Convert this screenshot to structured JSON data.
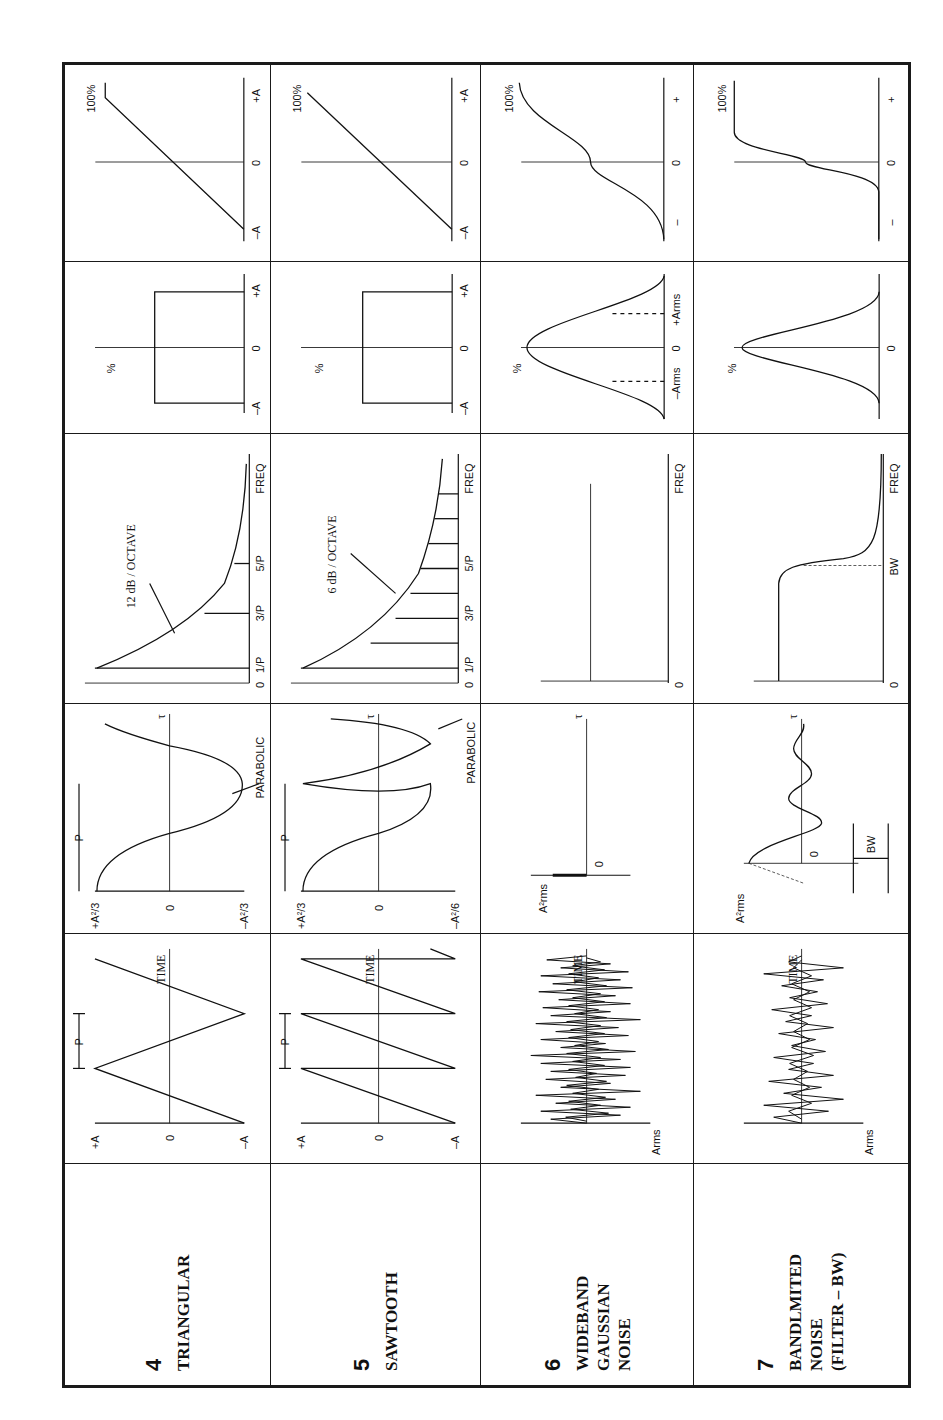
{
  "page": {
    "header_clipped": true,
    "orientation": "rotated -90deg (landscape table printed sideways)"
  },
  "table": {
    "columns": [
      "signal",
      "time_history",
      "autocorrelation",
      "spectrum",
      "amplitude_density",
      "cumulative_distribution"
    ],
    "rows": [
      {
        "number": "4",
        "name": "TRIANGULAR",
        "time_history": {
          "y_labels": [
            "+A",
            "0",
            "–A"
          ],
          "period_label": "P",
          "x_label": "TIME"
        },
        "autocorrelation": {
          "y_labels": [
            "+A²/3",
            "0",
            "–A²/3"
          ],
          "period_label": "P",
          "annotation": "PARABOLIC",
          "x_label": "τ"
        },
        "spectrum": {
          "annotation": "12 dB / OCTAVE",
          "x_labels": [
            "0",
            "1/P",
            "3/P",
            "5/P",
            "FREQ"
          ]
        },
        "amplitude_density": {
          "y_label": "%",
          "x_labels": [
            "–A",
            "0",
            "+A"
          ]
        },
        "cumulative_distribution": {
          "y_label": "100%",
          "x_labels": [
            "–A",
            "0",
            "+A"
          ]
        }
      },
      {
        "number": "5",
        "name": "SAWTOOTH",
        "time_history": {
          "y_labels": [
            "+A",
            "0",
            "–A"
          ],
          "period_label": "P",
          "x_label": "TIME"
        },
        "autocorrelation": {
          "y_labels": [
            "+A²/3",
            "0",
            "–A²/6"
          ],
          "period_label": "P",
          "annotation": "PARABOLIC",
          "x_label": "τ"
        },
        "spectrum": {
          "annotation": "6 dB / OCTAVE",
          "x_labels": [
            "0",
            "1/P",
            "3/P",
            "5/P",
            "FREQ"
          ]
        },
        "amplitude_density": {
          "y_label": "%",
          "x_labels": [
            "–A",
            "0",
            "+A"
          ]
        },
        "cumulative_distribution": {
          "y_label": "100%",
          "x_labels": [
            "–A",
            "0",
            "+A"
          ]
        }
      },
      {
        "number": "6",
        "name": "WIDEBAND\nGAUSSIAN\nNOISE",
        "time_history": {
          "y_labels": [
            "Arms"
          ],
          "x_label": "TIME"
        },
        "autocorrelation": {
          "y_labels": [
            "A²rms",
            "0"
          ],
          "x_label": "τ"
        },
        "spectrum": {
          "x_labels": [
            "0",
            "FREQ"
          ]
        },
        "amplitude_density": {
          "y_label": "%",
          "x_labels": [
            "–Arms",
            "0",
            "+Arms"
          ]
        },
        "cumulative_distribution": {
          "y_label": "100%",
          "x_labels": [
            "–",
            "0",
            "+"
          ]
        }
      },
      {
        "number": "7",
        "name": "BANDLMITED\nNOISE\n(FILTER – BW)",
        "time_history": {
          "y_labels": [
            "Arms"
          ],
          "x_label": "TIME"
        },
        "autocorrelation": {
          "y_labels": [
            "A²rms",
            "0"
          ],
          "bw_label": "BW",
          "x_label": "τ"
        },
        "spectrum": {
          "x_labels": [
            "0",
            "BW",
            "FREQ"
          ]
        },
        "amplitude_density": {
          "y_label": "%",
          "x_labels": [
            "0"
          ]
        },
        "cumulative_distribution": {
          "y_label": "100%",
          "x_labels": [
            "–",
            "0",
            "+"
          ]
        }
      }
    ]
  }
}
